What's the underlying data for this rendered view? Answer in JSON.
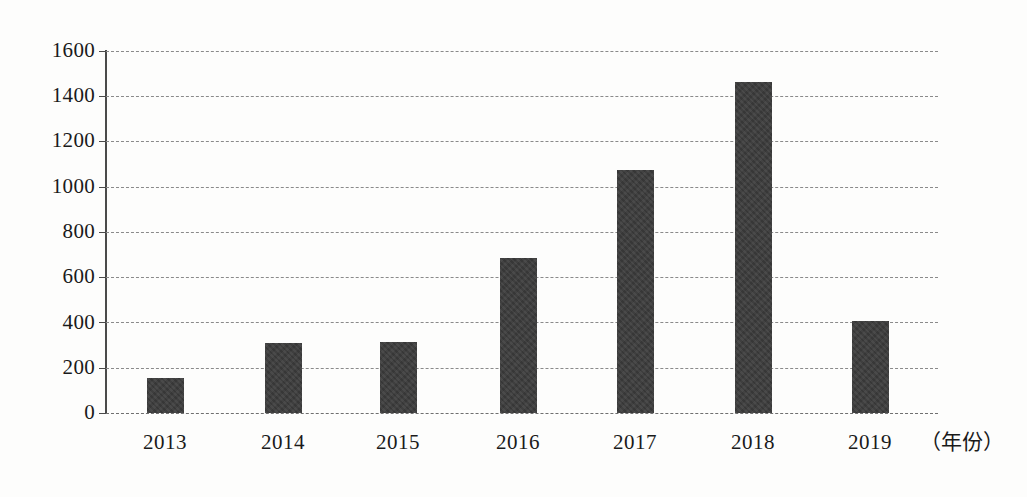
{
  "chart_data": {
    "type": "bar",
    "title": "",
    "subtitle": "",
    "xlabel": "（年份）",
    "ylabel": "",
    "categories": [
      "2013",
      "2014",
      "2015",
      "2016",
      "2017",
      "2018",
      "2019"
    ],
    "values": [
      155,
      310,
      315,
      685,
      1075,
      1465,
      405
    ],
    "series": [
      {
        "name": "数量",
        "values": [
          155,
          310,
          315,
          685,
          1075,
          1465,
          405
        ]
      }
    ],
    "ylim": [
      0,
      1600
    ],
    "ytick_labels": [
      "1600",
      "1400",
      "1200",
      "1000",
      "800",
      "600",
      "400",
      "200",
      "0"
    ],
    "ytick_values": [
      1600,
      1400,
      1200,
      1000,
      800,
      600,
      400,
      200,
      0
    ],
    "ytick_step": 200,
    "grid": true,
    "grid_style": "dashed-horizontal",
    "legend": false,
    "legend_position": "none",
    "bar_color": "#3c3c3c",
    "axis_color": "#4a4a4a",
    "gridline_color": "#8a8a8a",
    "background_color": "#fdfdfc",
    "annotations": []
  },
  "axis": {
    "x_title": "（年份）"
  }
}
